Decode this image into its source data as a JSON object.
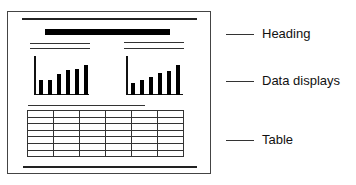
{
  "diagram": {
    "labels": [
      {
        "id": "heading",
        "text": "Heading"
      },
      {
        "id": "data-displays",
        "text": "Data displays"
      },
      {
        "id": "table",
        "text": "Table"
      }
    ]
  },
  "chart_data": [
    {
      "type": "bar",
      "title": "",
      "categories": [
        "1",
        "2",
        "3",
        "4",
        "5",
        "6"
      ],
      "values": [
        15,
        15,
        21,
        25,
        26,
        30
      ],
      "xlabel": "",
      "ylabel": "",
      "grid": false
    },
    {
      "type": "bar",
      "title": "",
      "categories": [
        "1",
        "2",
        "3",
        "4",
        "5",
        "6"
      ],
      "values": [
        12,
        15,
        18,
        22,
        24,
        30
      ],
      "xlabel": "",
      "ylabel": "",
      "grid": false
    }
  ],
  "table": {
    "rows": 7,
    "cols": 6
  }
}
